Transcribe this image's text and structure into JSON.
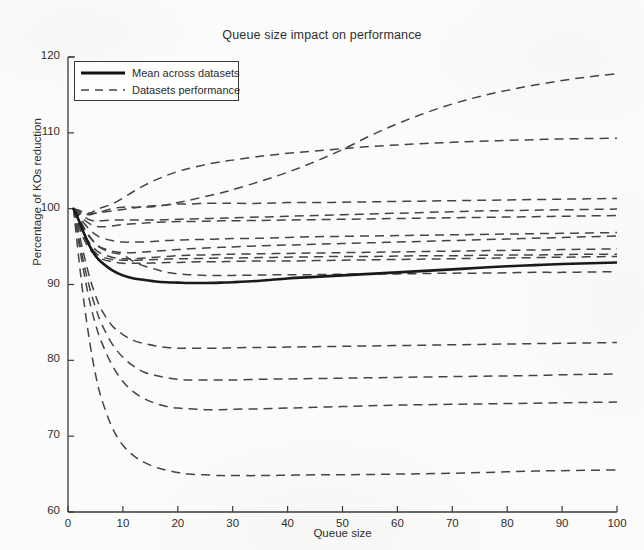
{
  "chart": {
    "title": "Queue size impact on performance",
    "xlabel": "Queue size",
    "ylabel": "Percentage of KOs reduction",
    "legend": {
      "mean_label": "Mean across datasets",
      "datasets_label": "Datasets performance"
    },
    "xticks": [
      "0",
      "10",
      "20",
      "30",
      "40",
      "50",
      "60",
      "70",
      "80",
      "90",
      "100"
    ],
    "yticks": [
      "60",
      "70",
      "80",
      "90",
      "100",
      "110",
      "120"
    ]
  },
  "chart_data": {
    "type": "line",
    "title": "Queue size impact on performance",
    "xlabel": "Queue size",
    "ylabel": "Percentage of KOs reduction",
    "xlim": [
      0,
      100
    ],
    "ylim": [
      60,
      120
    ],
    "xticks": [
      0,
      10,
      20,
      30,
      40,
      50,
      60,
      70,
      80,
      90,
      100
    ],
    "yticks": [
      60,
      70,
      80,
      90,
      100,
      110,
      120
    ],
    "grid": false,
    "legend_position": "upper left",
    "legend_entries": [
      "Mean across datasets",
      "Datasets performance"
    ],
    "x": [
      1,
      2,
      3,
      4,
      5,
      6,
      8,
      10,
      12,
      14,
      16,
      18,
      20,
      22,
      25,
      28,
      30,
      35,
      40,
      45,
      50,
      55,
      60,
      65,
      70,
      75,
      80,
      85,
      90,
      95,
      100
    ],
    "series": [
      {
        "name": "Mean across datasets",
        "style": "solid",
        "linewidth": 2.6,
        "color": "#1a1a1a",
        "values": [
          100.0,
          98.4,
          96.6,
          95.0,
          93.8,
          93.0,
          91.9,
          91.2,
          90.8,
          90.6,
          90.4,
          90.3,
          90.25,
          90.2,
          90.2,
          90.25,
          90.3,
          90.5,
          90.8,
          91.0,
          91.2,
          91.4,
          91.6,
          91.8,
          92.0,
          92.2,
          92.4,
          92.55,
          92.7,
          92.8,
          92.9
        ]
      },
      {
        "name": "Dataset 1",
        "style": "dashed",
        "values": [
          100.0,
          99.4,
          99.2,
          99.4,
          99.8,
          100.1,
          100.6,
          101.4,
          102.3,
          103.1,
          103.8,
          104.4,
          104.9,
          105.3,
          105.8,
          106.2,
          106.4,
          106.9,
          107.3,
          107.6,
          107.9,
          108.2,
          108.4,
          108.6,
          108.75,
          108.9,
          109.0,
          109.1,
          109.2,
          109.25,
          109.3
        ]
      },
      {
        "name": "Dataset 2",
        "style": "dashed",
        "values": [
          100.0,
          99.6,
          99.3,
          99.2,
          99.4,
          99.6,
          100.0,
          100.2,
          100.2,
          100.2,
          100.3,
          100.5,
          100.8,
          101.1,
          101.6,
          102.1,
          102.5,
          103.6,
          104.8,
          106.2,
          107.8,
          109.6,
          111.2,
          112.6,
          113.8,
          114.8,
          115.6,
          116.3,
          116.9,
          117.4,
          117.8
        ]
      },
      {
        "name": "Dataset 3",
        "style": "dashed",
        "values": [
          100.0,
          99.8,
          99.5,
          99.4,
          99.4,
          99.5,
          99.7,
          99.9,
          100.1,
          100.3,
          100.4,
          100.5,
          100.6,
          100.6,
          100.7,
          100.7,
          100.7,
          100.7,
          100.8,
          100.8,
          100.85,
          100.9,
          100.95,
          101.0,
          101.05,
          101.1,
          101.15,
          101.2,
          101.25,
          101.3,
          101.35
        ]
      },
      {
        "name": "Dataset 4",
        "style": "dashed",
        "values": [
          100.0,
          99.4,
          98.9,
          98.5,
          98.4,
          98.4,
          98.5,
          98.5,
          98.5,
          98.5,
          98.5,
          98.55,
          98.6,
          98.65,
          98.7,
          98.75,
          98.8,
          98.9,
          99.0,
          99.1,
          99.2,
          99.3,
          99.4,
          99.5,
          99.6,
          99.7,
          99.75,
          99.8,
          99.85,
          99.9,
          99.95
        ]
      },
      {
        "name": "Dataset 5",
        "style": "dashed",
        "values": [
          100.0,
          99.2,
          98.5,
          98.0,
          97.7,
          97.6,
          97.7,
          97.9,
          98.0,
          98.1,
          98.2,
          98.25,
          98.3,
          98.3,
          98.35,
          98.4,
          98.4,
          98.45,
          98.5,
          98.55,
          98.6,
          98.65,
          98.7,
          98.75,
          98.8,
          98.85,
          98.9,
          98.95,
          99.0,
          99.05,
          99.1
        ]
      },
      {
        "name": "Dataset 6",
        "style": "dashed",
        "values": [
          100.0,
          99.0,
          98.0,
          97.2,
          96.6,
          96.2,
          95.8,
          95.6,
          95.6,
          95.6,
          95.7,
          95.8,
          95.85,
          95.9,
          95.95,
          96.0,
          96.05,
          96.1,
          96.2,
          96.3,
          96.35,
          96.4,
          96.45,
          96.5,
          96.55,
          96.6,
          96.65,
          96.7,
          96.75,
          96.8,
          96.85
        ]
      },
      {
        "name": "Dataset 7",
        "style": "dashed",
        "values": [
          100.0,
          98.6,
          97.2,
          96.2,
          95.4,
          94.9,
          94.4,
          94.2,
          94.2,
          94.3,
          94.4,
          94.5,
          94.6,
          94.7,
          94.8,
          94.9,
          94.95,
          95.1,
          95.2,
          95.3,
          95.4,
          95.5,
          95.6,
          95.7,
          95.8,
          95.9,
          96.0,
          96.1,
          96.2,
          96.3,
          96.4
        ]
      },
      {
        "name": "Dataset 8",
        "style": "dashed",
        "values": [
          100.0,
          98.2,
          96.6,
          95.4,
          94.6,
          94.1,
          93.6,
          93.4,
          93.4,
          93.5,
          93.6,
          93.7,
          93.8,
          93.85,
          93.9,
          93.95,
          94.0,
          94.05,
          94.1,
          94.15,
          94.2,
          94.25,
          94.3,
          94.35,
          94.4,
          94.45,
          94.5,
          94.55,
          94.6,
          94.65,
          94.7
        ]
      },
      {
        "name": "Dataset 9",
        "style": "dashed",
        "values": [
          100.0,
          98.0,
          96.2,
          95.0,
          94.2,
          93.7,
          93.3,
          93.2,
          93.2,
          93.25,
          93.3,
          93.35,
          93.4,
          93.4,
          93.45,
          93.5,
          93.5,
          93.55,
          93.6,
          93.65,
          93.7,
          93.7,
          93.75,
          93.8,
          93.8,
          93.85,
          93.9,
          93.9,
          93.95,
          94.0,
          94.0
        ]
      },
      {
        "name": "Dataset 10",
        "style": "dashed",
        "values": [
          100.0,
          97.6,
          95.8,
          94.6,
          93.9,
          93.4,
          93.0,
          92.8,
          92.8,
          92.8,
          92.85,
          92.9,
          92.9,
          92.95,
          93.0,
          93.0,
          93.05,
          93.1,
          93.1,
          93.15,
          93.2,
          93.25,
          93.3,
          93.35,
          93.4,
          93.45,
          93.5,
          93.55,
          93.6,
          93.65,
          93.7
        ]
      },
      {
        "name": "Dataset 11",
        "style": "dashed",
        "values": [
          100.0,
          98.8,
          97.4,
          96.3,
          95.4,
          94.8,
          94.2,
          93.9,
          93.0,
          92.4,
          92.0,
          91.6,
          91.4,
          91.3,
          91.2,
          91.2,
          91.2,
          91.25,
          91.3,
          91.3,
          91.35,
          91.4,
          91.4,
          91.45,
          91.5,
          91.5,
          91.55,
          91.6,
          91.6,
          91.65,
          91.7
        ]
      },
      {
        "name": "Dataset 12",
        "style": "dashed",
        "values": [
          100.0,
          96.8,
          93.6,
          90.8,
          88.6,
          86.8,
          84.6,
          83.4,
          82.6,
          82.2,
          81.9,
          81.7,
          81.6,
          81.6,
          81.6,
          81.6,
          81.65,
          81.7,
          81.75,
          81.8,
          81.85,
          81.9,
          81.95,
          82.0,
          82.05,
          82.1,
          82.15,
          82.2,
          82.25,
          82.3,
          82.35
        ]
      },
      {
        "name": "Dataset 13",
        "style": "dashed",
        "values": [
          100.0,
          96.0,
          92.4,
          89.4,
          87.0,
          85.0,
          82.2,
          80.4,
          79.2,
          78.4,
          78.0,
          77.7,
          77.5,
          77.4,
          77.4,
          77.4,
          77.4,
          77.5,
          77.55,
          77.6,
          77.65,
          77.7,
          77.75,
          77.8,
          77.85,
          77.9,
          77.95,
          78.0,
          78.1,
          78.15,
          78.2
        ]
      },
      {
        "name": "Dataset 14",
        "style": "dashed",
        "values": [
          100.0,
          95.4,
          91.2,
          87.6,
          84.8,
          82.6,
          79.4,
          77.2,
          75.8,
          74.9,
          74.3,
          73.9,
          73.7,
          73.6,
          73.5,
          73.5,
          73.55,
          73.6,
          73.7,
          73.8,
          73.9,
          74.0,
          74.1,
          74.15,
          74.2,
          74.25,
          74.3,
          74.35,
          74.4,
          74.45,
          74.5
        ]
      },
      {
        "name": "Dataset 15",
        "style": "dashed",
        "values": [
          100.0,
          93.2,
          87.2,
          82.2,
          78.2,
          75.2,
          71.2,
          68.8,
          67.4,
          66.5,
          65.9,
          65.5,
          65.2,
          65.0,
          64.9,
          64.8,
          64.8,
          64.8,
          64.85,
          64.9,
          64.9,
          64.95,
          65.0,
          65.05,
          65.1,
          65.2,
          65.3,
          65.4,
          65.45,
          65.5,
          65.55
        ]
      }
    ]
  },
  "style": {
    "axis_color": "#3a3a3a",
    "line_color": "#444444",
    "mean_color": "#111111",
    "background": "#fbfbf9"
  }
}
